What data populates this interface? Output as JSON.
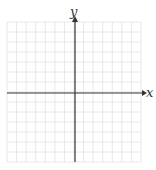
{
  "diagram": {
    "type": "coordinate-plane",
    "x_axis_label": "x",
    "y_axis_label": "y",
    "grid": {
      "columns": 14,
      "rows": 14,
      "left": 7,
      "top": 22,
      "right": 141,
      "bottom": 162,
      "color": "#e2e2e2"
    },
    "axis_color": "#333333",
    "origin": {
      "x": 75,
      "y": 93
    }
  }
}
